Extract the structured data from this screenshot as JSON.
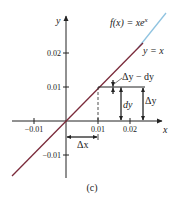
{
  "figure": {
    "caption": "(c)",
    "function_label": "f(x) = xe^x",
    "function_label_parts": {
      "prefix": "f(x) = xe",
      "sup": "x"
    },
    "tangent_label": "y = x",
    "axes": {
      "x_label": "x",
      "y_label": "y",
      "x_ticks": [
        "−0.01",
        "0.01",
        "0.02"
      ],
      "y_ticks": [
        "0.02",
        "0.01",
        "−0.01"
      ]
    },
    "annotations": {
      "delta_x": "Δx",
      "dy": "dy",
      "delta_y": "Δy",
      "difference": "Δy − dy"
    },
    "colors": {
      "tangent_line": "#7a2a3a",
      "curve": "#8fc3e0",
      "axes": "#222222"
    }
  }
}
